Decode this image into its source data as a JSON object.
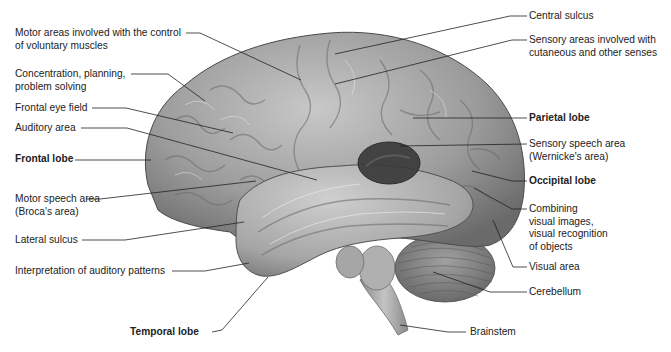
{
  "figure": {
    "colors": {
      "background": "#ffffff",
      "brain_base": "#9a9a9a",
      "brain_light": "#c9c9c9",
      "brain_dark": "#5e5e5e",
      "wernicke_area": "#3a3a3a",
      "leader_line": "#222222",
      "label_text": "#222222"
    }
  },
  "labels_left": [
    {
      "id": "motor-areas",
      "lines": [
        "Motor areas involved with the control",
        "of voluntary muscles"
      ],
      "bold": false
    },
    {
      "id": "concentration",
      "lines": [
        "Concentration, planning,",
        "problem solving"
      ],
      "bold": false
    },
    {
      "id": "frontal-eye-field",
      "lines": [
        "Frontal eye field"
      ],
      "bold": false
    },
    {
      "id": "auditory-area",
      "lines": [
        "Auditory area"
      ],
      "bold": false
    },
    {
      "id": "frontal-lobe",
      "lines": [
        "Frontal lobe"
      ],
      "bold": true
    },
    {
      "id": "motor-speech-area",
      "lines": [
        "Motor speech area",
        "(Broca's area)"
      ],
      "bold": false
    },
    {
      "id": "lateral-sulcus",
      "lines": [
        "Lateral sulcus"
      ],
      "bold": false
    },
    {
      "id": "interpretation-auditory",
      "lines": [
        "Interpretation of auditory patterns"
      ],
      "bold": false
    },
    {
      "id": "temporal-lobe",
      "lines": [
        "Temporal lobe"
      ],
      "bold": true
    }
  ],
  "labels_right": [
    {
      "id": "central-sulcus",
      "lines": [
        "Central sulcus"
      ],
      "bold": false
    },
    {
      "id": "sensory-areas",
      "lines": [
        "Sensory areas involved with",
        "cutaneous and other senses"
      ],
      "bold": false
    },
    {
      "id": "parietal-lobe",
      "lines": [
        "Parietal lobe"
      ],
      "bold": true
    },
    {
      "id": "sensory-speech-area",
      "lines": [
        "Sensory speech area",
        "(Wernicke's area)"
      ],
      "bold": false
    },
    {
      "id": "occipital-lobe",
      "lines": [
        "Occipital lobe"
      ],
      "bold": true
    },
    {
      "id": "combining-visual",
      "lines": [
        "Combining",
        "visual images,",
        "visual recognition",
        "of objects"
      ],
      "bold": false
    },
    {
      "id": "visual-area",
      "lines": [
        "Visual area"
      ],
      "bold": false
    },
    {
      "id": "cerebellum",
      "lines": [
        "Cerebellum"
      ],
      "bold": false
    },
    {
      "id": "brainstem",
      "lines": [
        "Brainstem"
      ],
      "bold": false
    }
  ]
}
